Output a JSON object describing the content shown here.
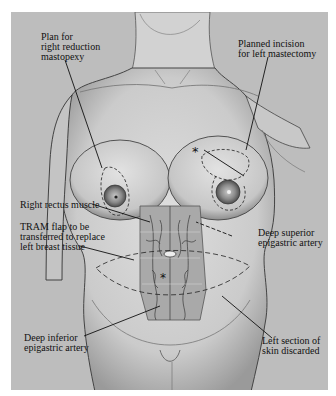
{
  "figure": {
    "type": "surgical-illustration",
    "background_color": "#bdbdbd",
    "markers": [
      "*",
      "*"
    ],
    "labels": [
      {
        "id": "plan-right-reduction",
        "text": "Plan for\nright reduction\nmastopexy"
      },
      {
        "id": "planned-incision-left",
        "text": "Planned incision\nfor left mastectomy"
      },
      {
        "id": "right-rectus-muscle",
        "text": "Right rectus muscle"
      },
      {
        "id": "tram-flap",
        "text": "TRAM flap to be\ntransferred to replace\nleft breast tissue"
      },
      {
        "id": "deep-superior-epigastric",
        "text": "Deep superior\nepigastric artery"
      },
      {
        "id": "deep-inferior-epigastric",
        "text": "Deep inferior\nepigastric artery"
      },
      {
        "id": "left-section-skin",
        "text": "Left section of\nskin discarded"
      }
    ]
  }
}
